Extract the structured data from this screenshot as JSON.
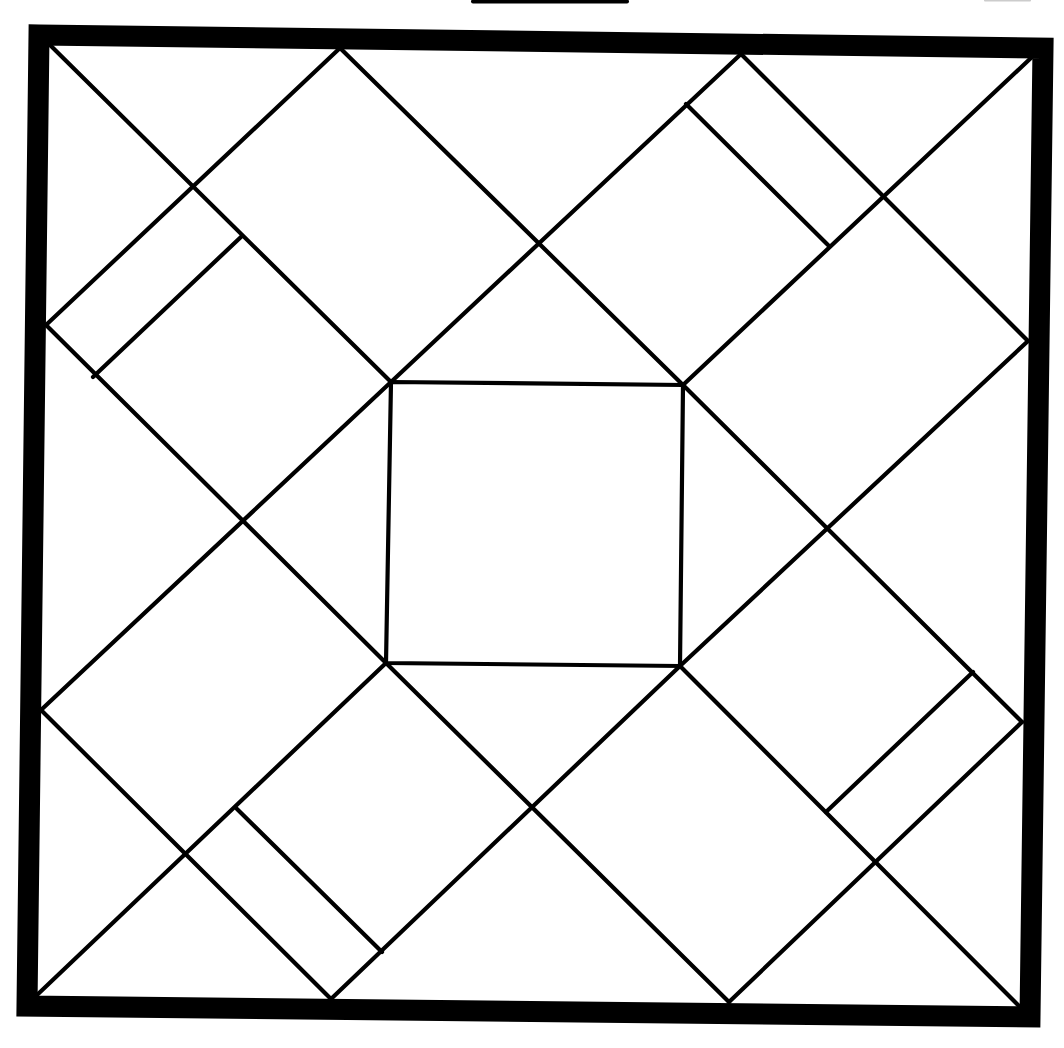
{
  "diagram": {
    "type": "quilt-block-line-drawing",
    "background": "#ffffff",
    "stroke_color": "#000000",
    "line_width": 4.2,
    "border_width": 21,
    "top_bar": {
      "x1": 473,
      "y1": 1.5,
      "x2": 627,
      "y2": 1.5,
      "width": 4
    },
    "top_mark": {
      "x1": 985,
      "y1": 0.5,
      "x2": 1030,
      "y2": 0.5,
      "width": 2,
      "color": "#cccccc"
    },
    "outer_frame": {
      "points": "39,35 1043,48 1030,1017 27,1006"
    },
    "center_square": {
      "points": "391,382 683,385 680,666 386,663"
    },
    "lines": [
      {
        "id": "diag-tl-in",
        "x1": 50,
        "y1": 45,
        "x2": 391,
        "y2": 382
      },
      {
        "id": "diag-br-in",
        "x1": 680,
        "y1": 666,
        "x2": 1020,
        "y2": 1007
      },
      {
        "id": "diag-bl-in",
        "x1": 37,
        "y1": 995,
        "x2": 386,
        "y2": 663
      },
      {
        "id": "diag-tr-in",
        "x1": 683,
        "y1": 385,
        "x2": 1032,
        "y2": 57
      },
      {
        "id": "l-left-top",
        "x1": 46,
        "y1": 325,
        "x2": 340,
        "y2": 48
      },
      {
        "id": "l-top-a",
        "x1": 340,
        "y1": 48,
        "x2": 683,
        "y2": 385
      },
      {
        "id": "l-top-b",
        "x1": 741,
        "y1": 54,
        "x2": 391,
        "y2": 382
      },
      {
        "id": "l-right-top",
        "x1": 741,
        "y1": 54,
        "x2": 1028,
        "y2": 341
      },
      {
        "id": "l-left-mid-a",
        "x1": 46,
        "y1": 325,
        "x2": 386,
        "y2": 663
      },
      {
        "id": "l-left-mid-b",
        "x1": 41,
        "y1": 710,
        "x2": 391,
        "y2": 382
      },
      {
        "id": "l-right-mid-a",
        "x1": 1028,
        "y1": 341,
        "x2": 680,
        "y2": 666
      },
      {
        "id": "l-right-mid-b",
        "x1": 683,
        "y1": 385,
        "x2": 1022,
        "y2": 722
      },
      {
        "id": "l-left-bot",
        "x1": 41,
        "y1": 710,
        "x2": 331,
        "y2": 999
      },
      {
        "id": "l-bot-a",
        "x1": 331,
        "y1": 999,
        "x2": 680,
        "y2": 666
      },
      {
        "id": "l-bot-b",
        "x1": 386,
        "y1": 663,
        "x2": 729,
        "y2": 1002
      },
      {
        "id": "l-right-bot",
        "x1": 729,
        "y1": 1002,
        "x2": 1022,
        "y2": 722
      }
    ],
    "stubs": [
      {
        "id": "stub-top-right",
        "x1": 686,
        "y1": 104,
        "x2": 828,
        "y2": 245
      },
      {
        "id": "stub-left-top",
        "x1": 242,
        "y1": 236,
        "x2": 93,
        "y2": 377
      },
      {
        "id": "stub-bottom-left",
        "x1": 237,
        "y1": 809,
        "x2": 382,
        "y2": 952
      },
      {
        "id": "stub-right-bottom",
        "x1": 973,
        "y1": 672,
        "x2": 826,
        "y2": 812
      }
    ]
  }
}
